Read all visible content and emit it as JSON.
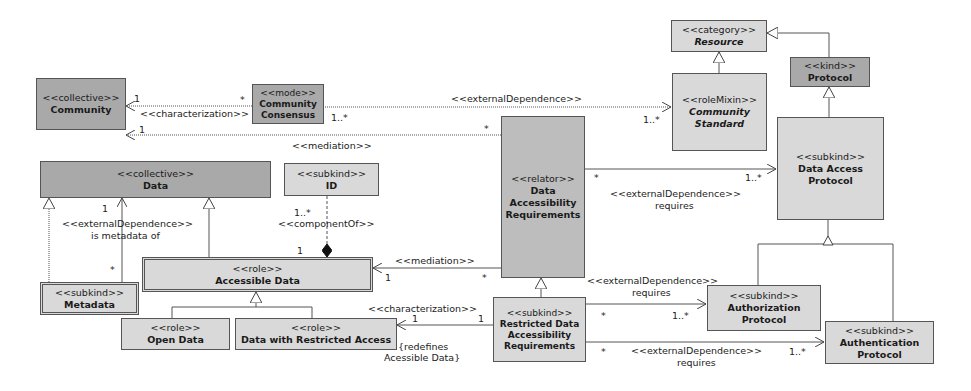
{
  "classes": {
    "community": {
      "stereotype": "<<collective>>",
      "name": "Community"
    },
    "community_consensus": {
      "stereotype": "<<mode>>",
      "name": "Community Consensus"
    },
    "resource": {
      "stereotype": "<<category>>",
      "name": "Resource"
    },
    "community_standard": {
      "stereotype": "<<roleMixin>>",
      "name": "Community Standard"
    },
    "protocol": {
      "stereotype": "<<kind>>",
      "name": "Protocol"
    },
    "data_access_protocol": {
      "stereotype": "<<subkind>>",
      "name": "Data Access Protocol"
    },
    "data": {
      "stereotype": "<<collective>>",
      "name": "Data"
    },
    "id": {
      "stereotype": "<<subkind>>",
      "name": "ID"
    },
    "data_accessibility_requirements": {
      "stereotype": "<<relator>>",
      "name": "Data Accessibility Requirements"
    },
    "accessible_data": {
      "stereotype": "<<role>>",
      "name": "Accessible Data"
    },
    "metadata": {
      "stereotype": "<<subkind>>",
      "name": "Metadata"
    },
    "open_data": {
      "stereotype": "<<role>>",
      "name": "Open Data"
    },
    "data_restricted": {
      "stereotype": "<<role>>",
      "name": "Data with Restricted Access"
    },
    "restricted_dar": {
      "stereotype": "<<subkind>>",
      "name": "Restricted Data Accessibility Requirements"
    },
    "authorization_protocol": {
      "stereotype": "<<subkind>>",
      "name": "Authorization Protocol"
    },
    "authentication_protocol": {
      "stereotype": "<<subkind>>",
      "name": "Authentication Protocol"
    }
  },
  "labels": {
    "char1": "<<characterization>>",
    "char1_m1": "1",
    "char1_m2": "*",
    "med1": "<<mediation>>",
    "med1_m1": "1",
    "med1_m2": "*",
    "extdep_cs": "<<externalDependence>>",
    "extdep_cs_m1": "1..*",
    "extdep_cs_m2": "1..*",
    "extdep_dap": "<<externalDependence>>",
    "extdep_dap_sub": "requires",
    "extdep_dap_m1": "*",
    "extdep_dap_m2": "1..*",
    "meta_dep": "<<externalDependence>>",
    "meta_dep_sub": "is metadata of",
    "meta_m1": "1",
    "meta_m2": "*",
    "comp": "<<componentOf>>",
    "comp_m1": "1..*",
    "comp_m2": "1",
    "med2": "<<mediation>>",
    "med2_m1": "1",
    "med2_m2": "*",
    "char2": "<<characterization>>",
    "char2_m1": "1",
    "char2_m2": "1",
    "redefines": "{redefines",
    "redefines2": "Acessible Data}",
    "extdep_auth": "<<externalDependence>>",
    "extdep_auth_sub": "requires",
    "extdep_auth_m1": "*",
    "extdep_auth_m2": "1..*",
    "extdep_authn": "<<externalDependence>>",
    "extdep_authn_sub": "requires",
    "extdep_authn_m1": "*",
    "extdep_authn_m2": "1..*"
  }
}
